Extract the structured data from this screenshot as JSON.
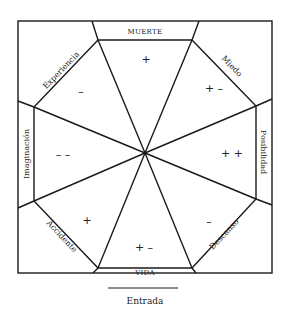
{
  "diagram": {
    "type": "octagonal-wheel",
    "bands": {
      "top": "MUERTE",
      "bottom": "VIDA",
      "left": "Imaginación",
      "right": "Posibilidad"
    },
    "diagonal_labels": {
      "top_left": "Experiencia",
      "top_right": "Miedo",
      "bottom_left": "Accidente",
      "bottom_right": "Descanso"
    },
    "sector_signs": {
      "top": "+",
      "top_right": "+ –",
      "right": "+ +",
      "bottom_right": "–",
      "bottom": "+ –",
      "bottom_left": "+",
      "left": "– –",
      "top_left": "–"
    },
    "entrance_label": "Entrada"
  },
  "colors": {
    "line": "#1a1a1a",
    "text": "#222222",
    "background": "#ffffff"
  }
}
